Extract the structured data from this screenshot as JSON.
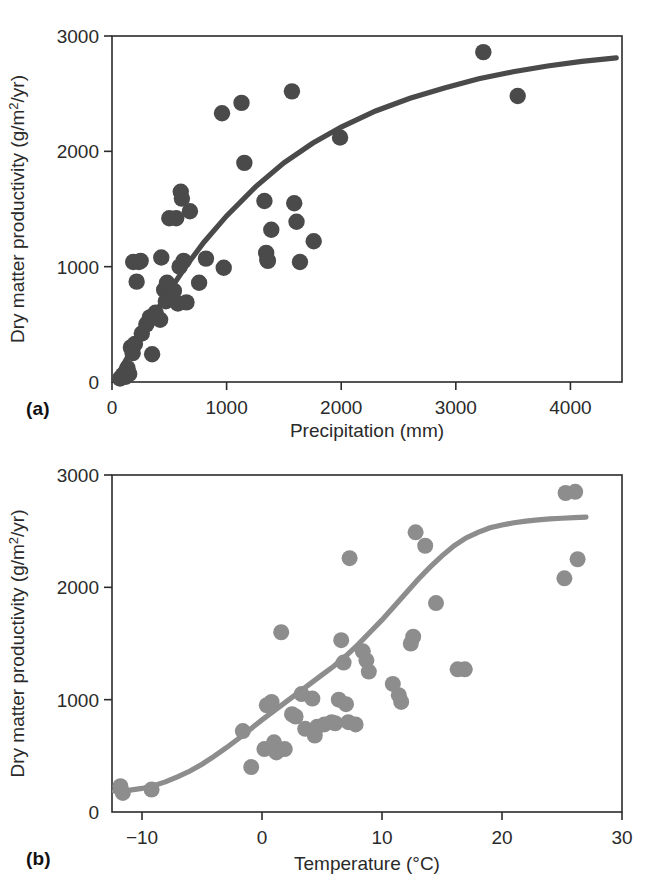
{
  "figure": {
    "panels": [
      {
        "id": "a",
        "label": "(a)",
        "axis": {
          "ylabel": "Dry matter productivity (g/m²/yr)",
          "xlabel": "Precipitation (mm)",
          "xticks": [
            "0",
            "1000",
            "2000",
            "3000",
            "4000"
          ],
          "yticks": [
            "0",
            "1000",
            "2000",
            "3000"
          ]
        }
      },
      {
        "id": "b",
        "label": "(b)",
        "axis": {
          "ylabel": "Dry matter productivity (g/m²/yr)",
          "xlabel": "Temperature (°C)",
          "xticks": [
            "−10",
            "0",
            "10",
            "20",
            "30"
          ],
          "yticks": [
            "0",
            "1000",
            "2000",
            "3000"
          ]
        }
      }
    ],
    "colors": {
      "panel_a_marker": "#4a4a4a",
      "panel_a_curve": "#4a4a4a",
      "panel_b_marker": "#8d8d8d",
      "panel_b_curve": "#8d8d8d",
      "axis": "#2b2b2b",
      "background": "#ffffff"
    }
  },
  "chart_data": [
    {
      "type": "scatter",
      "panel": "a",
      "title": "",
      "xlabel": "Precipitation (mm)",
      "ylabel": "Dry matter productivity (g/m²/yr)",
      "xlim": [
        0,
        4450
      ],
      "ylim": [
        0,
        3000
      ],
      "xticks": [
        0,
        1000,
        2000,
        3000,
        4000
      ],
      "yticks": [
        0,
        1000,
        2000,
        3000
      ],
      "grid": false,
      "legend": null,
      "points": [
        [
          70,
          30
        ],
        [
          95,
          60
        ],
        [
          120,
          45
        ],
        [
          135,
          120
        ],
        [
          150,
          70
        ],
        [
          165,
          300
        ],
        [
          180,
          250
        ],
        [
          185,
          1040
        ],
        [
          200,
          330
        ],
        [
          215,
          870
        ],
        [
          235,
          1040
        ],
        [
          250,
          1050
        ],
        [
          260,
          420
        ],
        [
          300,
          500
        ],
        [
          330,
          560
        ],
        [
          350,
          240
        ],
        [
          380,
          600
        ],
        [
          420,
          540
        ],
        [
          430,
          1080
        ],
        [
          455,
          800
        ],
        [
          470,
          700
        ],
        [
          480,
          860
        ],
        [
          500,
          1420
        ],
        [
          520,
          740
        ],
        [
          540,
          790
        ],
        [
          560,
          1420
        ],
        [
          575,
          680
        ],
        [
          590,
          1000
        ],
        [
          600,
          1650
        ],
        [
          610,
          1590
        ],
        [
          625,
          1050
        ],
        [
          650,
          690
        ],
        [
          680,
          1480
        ],
        [
          760,
          860
        ],
        [
          820,
          1070
        ],
        [
          960,
          2330
        ],
        [
          975,
          990
        ],
        [
          1130,
          2420
        ],
        [
          1155,
          1900
        ],
        [
          1330,
          1570
        ],
        [
          1345,
          1120
        ],
        [
          1355,
          1060
        ],
        [
          1360,
          1050
        ],
        [
          1390,
          1320
        ],
        [
          1570,
          2520
        ],
        [
          1590,
          1550
        ],
        [
          1610,
          1390
        ],
        [
          1640,
          1040
        ],
        [
          1760,
          1220
        ],
        [
          1990,
          2120
        ],
        [
          3240,
          2860
        ],
        [
          3540,
          2480
        ]
      ],
      "fit_curve": {
        "description": "saturating (asymptotic) fit",
        "points": [
          [
            60,
            80
          ],
          [
            200,
            330
          ],
          [
            350,
            560
          ],
          [
            500,
            790
          ],
          [
            650,
            1010
          ],
          [
            800,
            1210
          ],
          [
            1000,
            1440
          ],
          [
            1250,
            1690
          ],
          [
            1500,
            1900
          ],
          [
            1750,
            2070
          ],
          [
            2000,
            2210
          ],
          [
            2300,
            2350
          ],
          [
            2600,
            2460
          ],
          [
            2900,
            2550
          ],
          [
            3200,
            2630
          ],
          [
            3500,
            2690
          ],
          [
            3800,
            2740
          ],
          [
            4100,
            2780
          ],
          [
            4400,
            2810
          ]
        ]
      }
    },
    {
      "type": "scatter",
      "panel": "b",
      "title": "",
      "xlabel": "Temperature (°C)",
      "ylabel": "Dry matter productivity (g/m²/yr)",
      "xlim": [
        -12.5,
        30
      ],
      "ylim": [
        0,
        3000
      ],
      "xticks": [
        -10,
        0,
        10,
        20,
        30
      ],
      "yticks": [
        0,
        1000,
        2000,
        3000
      ],
      "grid": false,
      "legend": null,
      "points": [
        [
          -11.8,
          230
        ],
        [
          -11.6,
          170
        ],
        [
          -9.2,
          200
        ],
        [
          -1.6,
          720
        ],
        [
          -0.9,
          400
        ],
        [
          0.2,
          560
        ],
        [
          0.4,
          950
        ],
        [
          0.8,
          980
        ],
        [
          1.0,
          620
        ],
        [
          1.2,
          530
        ],
        [
          1.6,
          1600
        ],
        [
          1.9,
          560
        ],
        [
          2.5,
          870
        ],
        [
          2.8,
          850
        ],
        [
          3.3,
          1050
        ],
        [
          3.6,
          740
        ],
        [
          4.2,
          1010
        ],
        [
          4.4,
          680
        ],
        [
          4.6,
          760
        ],
        [
          5.2,
          780
        ],
        [
          5.8,
          800
        ],
        [
          6.1,
          790
        ],
        [
          6.4,
          1000
        ],
        [
          6.6,
          1530
        ],
        [
          6.8,
          1330
        ],
        [
          7.0,
          960
        ],
        [
          7.2,
          800
        ],
        [
          7.3,
          2260
        ],
        [
          7.8,
          780
        ],
        [
          8.4,
          1430
        ],
        [
          8.7,
          1350
        ],
        [
          8.9,
          1250
        ],
        [
          10.9,
          1140
        ],
        [
          11.4,
          1040
        ],
        [
          11.6,
          980
        ],
        [
          12.4,
          1500
        ],
        [
          12.6,
          1560
        ],
        [
          12.8,
          2490
        ],
        [
          13.6,
          2370
        ],
        [
          14.5,
          1860
        ],
        [
          16.3,
          1270
        ],
        [
          16.9,
          1270
        ],
        [
          25.2,
          2080
        ],
        [
          25.3,
          2840
        ],
        [
          26.1,
          2850
        ],
        [
          26.3,
          2250
        ]
      ],
      "fit_curve": {
        "description": "sigmoid (logistic) fit",
        "points": [
          [
            -12.3,
            185
          ],
          [
            -11,
            195
          ],
          [
            -10,
            210
          ],
          [
            -9,
            235
          ],
          [
            -8,
            270
          ],
          [
            -7,
            315
          ],
          [
            -6,
            365
          ],
          [
            -5,
            425
          ],
          [
            -4,
            495
          ],
          [
            -3,
            570
          ],
          [
            -2,
            650
          ],
          [
            -1,
            735
          ],
          [
            0,
            820
          ],
          [
            1,
            900
          ],
          [
            2,
            980
          ],
          [
            3,
            1060
          ],
          [
            4,
            1140
          ],
          [
            5,
            1220
          ],
          [
            6,
            1300
          ],
          [
            7,
            1390
          ],
          [
            8,
            1490
          ],
          [
            9,
            1600
          ],
          [
            10,
            1710
          ],
          [
            11,
            1830
          ],
          [
            12,
            1950
          ],
          [
            13,
            2070
          ],
          [
            14,
            2180
          ],
          [
            15,
            2280
          ],
          [
            16,
            2370
          ],
          [
            17,
            2440
          ],
          [
            18,
            2490
          ],
          [
            19,
            2530
          ],
          [
            20,
            2555
          ],
          [
            21,
            2575
          ],
          [
            22,
            2590
          ],
          [
            23,
            2600
          ],
          [
            24,
            2610
          ],
          [
            25,
            2615
          ],
          [
            26,
            2620
          ],
          [
            27,
            2625
          ]
        ]
      }
    }
  ]
}
